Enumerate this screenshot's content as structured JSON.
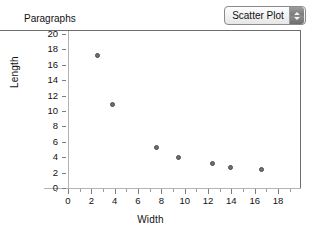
{
  "window": {
    "background": "#ffffff"
  },
  "toolbar": {
    "plot_type_selector": {
      "label": "Scatter Plot",
      "stepper_up_icon": "triangle-up-icon",
      "stepper_down_icon": "triangle-down-icon"
    }
  },
  "chart_data": {
    "type": "scatter",
    "title": "Paragraphs",
    "xlabel": "Width",
    "ylabel": "Length",
    "xlim": [
      -1.2,
      19.0
    ],
    "ylim": [
      0,
      20.4
    ],
    "xticks": [
      0,
      2,
      4,
      6,
      8,
      10,
      12,
      14,
      16,
      18
    ],
    "yticks": [
      0,
      2,
      4,
      6,
      8,
      10,
      12,
      14,
      16,
      18,
      20
    ],
    "grid": false,
    "legend": null,
    "marker_color": "#70706f",
    "marker_edge_color": "#4a4a4a",
    "axis_color": "#b4b4b4",
    "frame_color": "#6e6e6e",
    "points": [
      {
        "x": 2.5,
        "y": 17.2
      },
      {
        "x": 3.8,
        "y": 10.8
      },
      {
        "x": 7.6,
        "y": 5.2
      },
      {
        "x": 9.5,
        "y": 3.9
      },
      {
        "x": 12.4,
        "y": 3.2
      },
      {
        "x": 13.9,
        "y": 2.7
      },
      {
        "x": 16.6,
        "y": 2.4
      }
    ]
  }
}
